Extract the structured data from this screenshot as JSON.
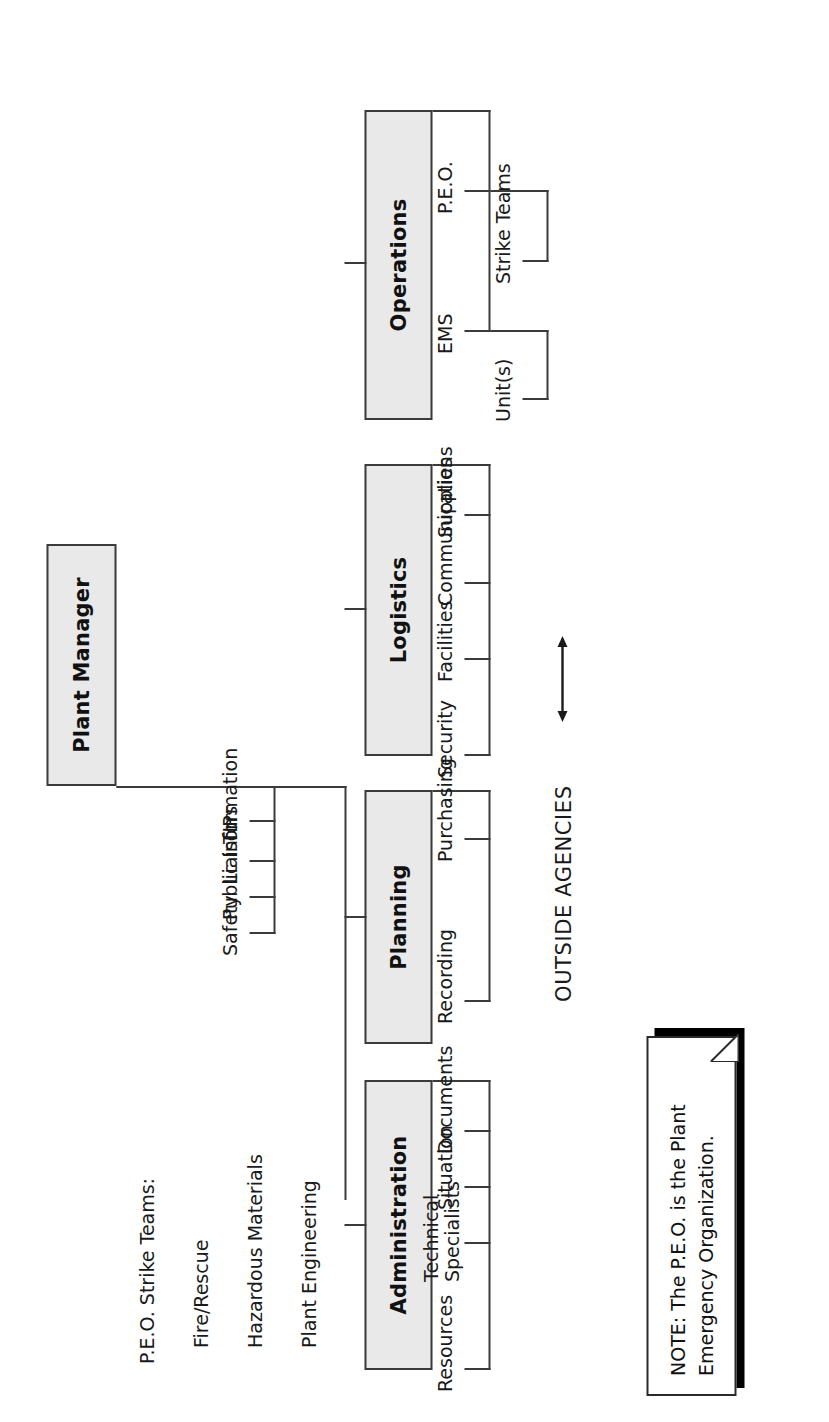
{
  "diagram": {
    "root": {
      "label": "Plant Manager"
    },
    "staff": [
      {
        "label": "TIPs"
      },
      {
        "label": "Liaison"
      },
      {
        "label": "Public Information"
      },
      {
        "label": "Safety"
      }
    ],
    "external": {
      "label": "OUTSIDE AGENCIES",
      "link": "double-arrow"
    },
    "sections": [
      {
        "label": "Administration",
        "children": [
          {
            "label": "Documents"
          },
          {
            "label": "Situation"
          },
          {
            "label": "Technical\nSpecialists"
          },
          {
            "label": "Resources"
          }
        ]
      },
      {
        "label": "Planning",
        "children": [
          {
            "label": "Purchasing"
          },
          {
            "label": "Recording"
          }
        ]
      },
      {
        "label": "Logistics",
        "children": [
          {
            "label": "Supplies"
          },
          {
            "label": "Communications"
          },
          {
            "label": "Facilities"
          },
          {
            "label": "Security"
          }
        ]
      },
      {
        "label": "Operations",
        "children": [
          {
            "label": "P.E.O.",
            "children": [
              {
                "label": "Strike Teams"
              }
            ]
          },
          {
            "label": "EMS",
            "children": [
              {
                "label": "Unit(s)"
              }
            ]
          }
        ]
      }
    ]
  },
  "legend": {
    "title": "P.E.O. Strike Teams:",
    "items": [
      "Fire/Rescue",
      "Hazardous Materials",
      "Plant Engineering"
    ]
  },
  "note": {
    "line1": "NOTE: The P.E.O. is the Plant",
    "line2": "Emergency Organization."
  },
  "tech_specialists": {
    "line1": "Technical",
    "line2": "Specialists"
  },
  "colors": {
    "box_fill": "#e9e9e9",
    "box_border": "#3b3b3b",
    "line": "#3b3b3b",
    "text": "#1a1a1a",
    "note_border": "#2a2a2a",
    "note_shadow": "#000000",
    "page_bg": "#ffffff"
  }
}
